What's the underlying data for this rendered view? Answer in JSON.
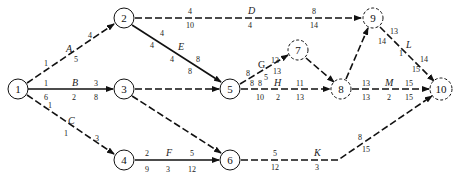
{
  "diagram": {
    "type": "activity-on-arrow network",
    "nodes": [
      {
        "id": "1",
        "x": 18,
        "y": 89,
        "dashed": false
      },
      {
        "id": "2",
        "x": 124,
        "y": 18,
        "dashed": false
      },
      {
        "id": "3",
        "x": 124,
        "y": 89,
        "dashed": false
      },
      {
        "id": "4",
        "x": 124,
        "y": 160,
        "dashed": false
      },
      {
        "id": "5",
        "x": 230,
        "y": 89,
        "dashed": false
      },
      {
        "id": "6",
        "x": 230,
        "y": 160,
        "dashed": false
      },
      {
        "id": "7",
        "x": 298,
        "y": 50,
        "dashed": true
      },
      {
        "id": "8",
        "x": 341,
        "y": 89,
        "dashed": true
      },
      {
        "id": "9",
        "x": 373,
        "y": 18,
        "dashed": true
      },
      {
        "id": "10",
        "x": 441,
        "y": 89,
        "dashed": true
      }
    ],
    "activities": [
      {
        "name": "A",
        "from": "1",
        "to": "2",
        "labels_top": [
          "1",
          "4"
        ],
        "labels_bottom": [
          "5"
        ],
        "dashed": true
      },
      {
        "name": "B",
        "from": "1",
        "to": "3",
        "labels_top": [
          "1",
          "3"
        ],
        "labels_bottom": [
          "6",
          "2",
          "8"
        ],
        "dashed": false
      },
      {
        "name": "C",
        "from": "1",
        "to": "4",
        "labels_top": [
          "1",
          "3"
        ],
        "labels_bottom": [
          "1"
        ],
        "dashed": true
      },
      {
        "name": "D",
        "from": "2",
        "to": "9",
        "labels_top": [
          "4",
          "8"
        ],
        "labels_bottom": [
          "10",
          "4",
          "14"
        ],
        "dashed": true
      },
      {
        "name": "E",
        "from": "2",
        "to": "5",
        "labels_top": [
          "4",
          "8"
        ],
        "labels_bottom": [
          "4",
          "4",
          "8"
        ],
        "dashed": false
      },
      {
        "name": "",
        "from": "3",
        "to": "5",
        "labels_top": [],
        "labels_bottom": [],
        "dashed": true
      },
      {
        "name": "",
        "from": "3",
        "to": "6",
        "labels_top": [],
        "labels_bottom": [],
        "dashed": true
      },
      {
        "name": "F",
        "from": "4",
        "to": "6",
        "labels_top": [
          "2",
          "5"
        ],
        "labels_bottom": [
          "9",
          "3",
          "12"
        ],
        "dashed": false
      },
      {
        "name": "G",
        "from": "5",
        "to": "7",
        "labels_top": [
          "8",
          "13"
        ],
        "labels_bottom": [
          "8",
          "5",
          "13"
        ],
        "dashed": true
      },
      {
        "name": "H",
        "from": "5",
        "to": "8",
        "labels_top": [
          "8",
          "11"
        ],
        "labels_bottom": [
          "10",
          "2",
          "13"
        ],
        "dashed": true
      },
      {
        "name": "",
        "from": "7",
        "to": "8",
        "labels_top": [],
        "labels_bottom": [],
        "dashed": true
      },
      {
        "name": "",
        "from": "8",
        "to": "9",
        "labels_top": [],
        "labels_bottom": [],
        "dashed": true
      },
      {
        "name": "M",
        "from": "8",
        "to": "10",
        "labels_top": [
          "13",
          "15"
        ],
        "labels_bottom": [
          "13",
          "2",
          "15"
        ],
        "dashed": true
      },
      {
        "name": "L",
        "from": "9",
        "to": "10",
        "labels_top": [
          "13",
          "14"
        ],
        "labels_bottom": [
          "14",
          "1",
          "15"
        ],
        "dashed": true
      },
      {
        "name": "K",
        "from": "6",
        "to": "10",
        "labels_top": [
          "5",
          "8"
        ],
        "labels_bottom": [
          "12",
          "3",
          "15"
        ],
        "dashed": true
      }
    ]
  },
  "text": {
    "n1": "1",
    "n2": "2",
    "n3": "3",
    "n4": "4",
    "n5": "5",
    "n6": "6",
    "n7": "7",
    "n8": "8",
    "n9": "9",
    "n10": "10",
    "A": "A",
    "B": "B",
    "C": "C",
    "D": "D",
    "E": "E",
    "F": "F",
    "G": "G",
    "H": "H",
    "K": "K",
    "L": "L",
    "M": "M",
    "A_es": "1",
    "A_ef": "4",
    "A_d": "5",
    "B_es": "1",
    "B_ef": "3",
    "B_ls": "6",
    "B_d": "2",
    "B_lf": "8",
    "C_es": "1",
    "C_ef": "3",
    "C_d": "1",
    "D_es": "4",
    "D_ef": "8",
    "D_ls": "10",
    "D_d": "4",
    "D_lf": "14",
    "E_es": "4",
    "E_ef": "8",
    "E_ls": "4",
    "E_d": "4",
    "E_lf": "8",
    "F_es": "2",
    "F_ef": "5",
    "F_ls": "9",
    "F_d": "3",
    "F_lf": "12",
    "G_es": "8",
    "G_ef": "13",
    "G_ls": "8",
    "G_d": "5",
    "G_lf": "13",
    "H_es": "8",
    "H_ef": "11",
    "H_ls": "10",
    "H_d": "2",
    "H_lf": "13",
    "M_es": "13",
    "M_ef": "15",
    "M_ls": "13",
    "M_d": "2",
    "M_lf": "15",
    "L_es": "13",
    "L_ef": "14",
    "L_ls": "14",
    "L_d": "1",
    "L_lf": "15",
    "K_es": "5",
    "K_ef": "8",
    "K_ls": "12",
    "K_d": "3",
    "K_lf": "15"
  }
}
